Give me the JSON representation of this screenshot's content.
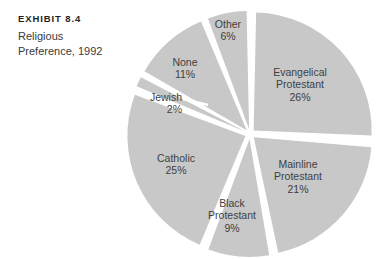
{
  "caption": {
    "exhibit_number": "EXHIBIT 8.4",
    "description": "Religious\nPreference, 1992"
  },
  "colors": {
    "slice_fill": "#c8c8c8",
    "gap": "#ffffff",
    "label_text": "#3f3f41",
    "caption_heading": "#231f20",
    "caption_body": "#3a3a3c"
  },
  "chart_data": {
    "type": "pie",
    "subtitle": "EXHIBIT 8.4",
    "xlabel": "",
    "ylabel": "",
    "legend_position": "none",
    "labels_inside_slices": true,
    "exploded": true,
    "start_angle_deg": 0,
    "direction": "clockwise",
    "units": "percent",
    "categories": [
      "Evangelical Protestant",
      "Mainline Protestant",
      "Black Protestant",
      "Catholic",
      "Jewish",
      "None",
      "Other"
    ],
    "values": [
      26,
      21,
      9,
      25,
      2,
      11,
      6
    ],
    "total": 100,
    "slices": [
      {
        "label": "Evangelical Protestant",
        "label_line1": "Evangelical",
        "label_line2": "Protestant",
        "value": 26,
        "value_text": "26%",
        "color": "#c8c8c8"
      },
      {
        "label": "Mainline Protestant",
        "label_line1": "Mainline",
        "label_line2": "Protestant",
        "value": 21,
        "value_text": "21%",
        "color": "#c8c8c8"
      },
      {
        "label": "Black Protestant",
        "label_line1": "Black",
        "label_line2": "Protestant",
        "value": 9,
        "value_text": "9%",
        "color": "#c8c8c8"
      },
      {
        "label": "Catholic",
        "label_line1": "Catholic",
        "label_line2": "",
        "value": 25,
        "value_text": "25%",
        "color": "#c8c8c8"
      },
      {
        "label": "Jewish",
        "label_line1": "Jewish",
        "label_line2": "",
        "value": 2,
        "value_text": "2%",
        "color": "#c8c8c8"
      },
      {
        "label": "None",
        "label_line1": "None",
        "label_line2": "",
        "value": 11,
        "value_text": "11%",
        "color": "#c8c8c8"
      },
      {
        "label": "Other",
        "label_line1": "Other",
        "label_line2": "",
        "value": 6,
        "value_text": "6%",
        "color": "#c8c8c8"
      }
    ]
  }
}
